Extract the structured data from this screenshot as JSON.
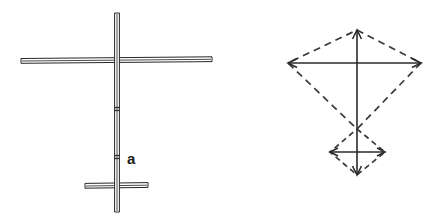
{
  "figure": {
    "background_color": "#ffffff",
    "line_color": "#2b2b2b",
    "width": 441,
    "height": 222,
    "labels": [
      {
        "id": "a",
        "text": "a",
        "x": 127,
        "y": 164,
        "weight": "bold",
        "size": 15
      }
    ],
    "panels": [
      {
        "id": "left-panel",
        "name": "cross-frame-figure",
        "caption": "",
        "description": "Cross-shaped kite frame with vertical spine spar, upper horizontal cross spar and lower short cross spar",
        "members": [
          {
            "name": "vertical-spine-spar",
            "type": "spar",
            "orientation": "vertical",
            "x1": 117,
            "y1": 13,
            "x2": 117,
            "y2": 212,
            "thickness": 5
          },
          {
            "name": "upper-horizontal-spar",
            "type": "spar",
            "orientation": "horizontal",
            "x1": 21,
            "y1": 60,
            "x2": 212,
            "y2": 60,
            "thickness": 5
          },
          {
            "name": "lower-horizontal-spar",
            "type": "spar",
            "orientation": "horizontal",
            "x1": 85,
            "y1": 185,
            "x2": 148,
            "y2": 185,
            "thickness": 5
          }
        ],
        "marks": [
          {
            "name": "upper-notch-mark",
            "x": 117,
            "y": 108
          },
          {
            "name": "lower-notch-mark",
            "x": 117,
            "y": 156
          }
        ]
      },
      {
        "id": "right-panel",
        "name": "kite-outline-figure",
        "caption": "",
        "description": "Kite outline: large dashed diamond with solid arrowed axes and a small dashed diamond at the tail",
        "large_diamond": {
          "name": "large-dashed-diamond",
          "style": "dashed",
          "top": {
            "x": 357,
            "y": 30
          },
          "left": {
            "x": 288,
            "y": 63
          },
          "right": {
            "x": 421,
            "y": 63
          },
          "bottom": {
            "x": 357,
            "y": 129
          }
        },
        "small_diamond": {
          "name": "small-dashed-diamond",
          "style": "dashed",
          "top": {
            "x": 357,
            "y": 129
          },
          "left": {
            "x": 330,
            "y": 152
          },
          "right": {
            "x": 385,
            "y": 152
          },
          "bottom": {
            "x": 357,
            "y": 175
          }
        },
        "axes": [
          {
            "name": "main-vertical-axis",
            "style": "solid",
            "x1": 357,
            "y1": 30,
            "x2": 357,
            "y2": 175,
            "arrow_start": true,
            "arrow_end": true
          },
          {
            "name": "main-horizontal-axis",
            "style": "solid",
            "x1": 288,
            "y1": 63,
            "x2": 421,
            "y2": 63,
            "arrow_start": true,
            "arrow_end": true
          },
          {
            "name": "tail-horizontal-axis",
            "style": "solid",
            "x1": 330,
            "y1": 152,
            "x2": 385,
            "y2": 152,
            "arrow_start": true,
            "arrow_end": true
          }
        ]
      }
    ]
  }
}
